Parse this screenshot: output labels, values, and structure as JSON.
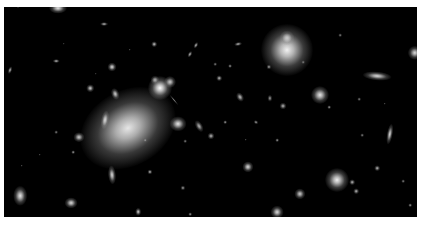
{
  "image": {
    "subject": "galaxy cluster deep field",
    "background": "#000000",
    "frame_color": "#ffffff"
  },
  "objects": [
    {
      "x": 128,
      "y": 128,
      "w": 46,
      "h": 34,
      "rot": -30,
      "b": 0.9,
      "halo": 2.2
    },
    {
      "x": 287,
      "y": 50,
      "w": 26,
      "h": 26,
      "rot": 0,
      "b": 0.95,
      "halo": 2.0
    },
    {
      "x": 287,
      "y": 38,
      "w": 10,
      "h": 10,
      "rot": 0,
      "b": 0.8,
      "halo": 1.5
    },
    {
      "x": 160,
      "y": 88,
      "w": 12,
      "h": 12,
      "rot": 0,
      "b": 1.0,
      "halo": 2.0
    },
    {
      "x": 170,
      "y": 82,
      "w": 8,
      "h": 8,
      "rot": 0,
      "b": 0.8,
      "halo": 1.5
    },
    {
      "x": 155,
      "y": 80,
      "w": 6,
      "h": 6,
      "rot": 0,
      "b": 0.7,
      "halo": 1.5
    },
    {
      "x": 174,
      "y": 100,
      "w": 14,
      "h": 2,
      "rot": 50,
      "b": 0.5,
      "halo": 1
    },
    {
      "x": 377,
      "y": 76,
      "w": 16,
      "h": 5,
      "rot": 5,
      "b": 0.85,
      "halo": 1.8
    },
    {
      "x": 320,
      "y": 95,
      "w": 10,
      "h": 10,
      "rot": 0,
      "b": 0.9,
      "halo": 1.8
    },
    {
      "x": 337,
      "y": 180,
      "w": 12,
      "h": 12,
      "rot": 0,
      "b": 0.95,
      "halo": 2.0
    },
    {
      "x": 105,
      "y": 120,
      "w": 5,
      "h": 12,
      "rot": 10,
      "b": 0.85,
      "halo": 1.6
    },
    {
      "x": 112,
      "y": 175,
      "w": 5,
      "h": 12,
      "rot": -5,
      "b": 0.85,
      "halo": 1.6
    },
    {
      "x": 20,
      "y": 196,
      "w": 8,
      "h": 12,
      "rot": 0,
      "b": 0.9,
      "halo": 1.7
    },
    {
      "x": 71,
      "y": 203,
      "w": 8,
      "h": 7,
      "rot": 0,
      "b": 0.85,
      "halo": 1.6
    },
    {
      "x": 79,
      "y": 137,
      "w": 7,
      "h": 6,
      "rot": 0,
      "b": 0.8,
      "halo": 1.6
    },
    {
      "x": 178,
      "y": 124,
      "w": 10,
      "h": 9,
      "rot": 0,
      "b": 0.9,
      "halo": 1.7
    },
    {
      "x": 199,
      "y": 126,
      "w": 5,
      "h": 9,
      "rot": -30,
      "b": 0.7,
      "halo": 1.4
    },
    {
      "x": 211,
      "y": 136,
      "w": 5,
      "h": 5,
      "rot": 0,
      "b": 0.7,
      "halo": 1.4
    },
    {
      "x": 248,
      "y": 167,
      "w": 7,
      "h": 7,
      "rot": 0,
      "b": 0.85,
      "halo": 1.6
    },
    {
      "x": 300,
      "y": 194,
      "w": 7,
      "h": 7,
      "rot": 0,
      "b": 0.8,
      "halo": 1.6
    },
    {
      "x": 277,
      "y": 212,
      "w": 8,
      "h": 8,
      "rot": 0,
      "b": 0.85,
      "halo": 1.6
    },
    {
      "x": 390,
      "y": 134,
      "w": 4,
      "h": 13,
      "rot": 10,
      "b": 0.85,
      "halo": 1.6
    },
    {
      "x": 415,
      "y": 53,
      "w": 9,
      "h": 9,
      "rot": 0,
      "b": 0.85,
      "halo": 1.6
    },
    {
      "x": 377,
      "y": 168,
      "w": 4,
      "h": 4,
      "rot": 0,
      "b": 0.7,
      "halo": 1.4
    },
    {
      "x": 352,
      "y": 182,
      "w": 4,
      "h": 4,
      "rot": 0,
      "b": 0.7,
      "halo": 1.4
    },
    {
      "x": 356,
      "y": 191,
      "w": 4,
      "h": 4,
      "rot": 0,
      "b": 0.7,
      "halo": 1.4
    },
    {
      "x": 283,
      "y": 106,
      "w": 5,
      "h": 5,
      "rot": 0,
      "b": 0.7,
      "halo": 1.4
    },
    {
      "x": 270,
      "y": 98,
      "w": 4,
      "h": 5,
      "rot": 0,
      "b": 0.6,
      "halo": 1.3
    },
    {
      "x": 240,
      "y": 97,
      "w": 5,
      "h": 7,
      "rot": -30,
      "b": 0.75,
      "halo": 1.4
    },
    {
      "x": 219,
      "y": 78,
      "w": 4,
      "h": 4,
      "rot": 0,
      "b": 0.7,
      "halo": 1.4
    },
    {
      "x": 230,
      "y": 66,
      "w": 3,
      "h": 3,
      "rot": 0,
      "b": 0.6,
      "halo": 1.3
    },
    {
      "x": 190,
      "y": 54,
      "w": 3,
      "h": 5,
      "rot": 30,
      "b": 0.7,
      "halo": 1.3
    },
    {
      "x": 196,
      "y": 45,
      "w": 3,
      "h": 5,
      "rot": 30,
      "b": 0.7,
      "halo": 1.3
    },
    {
      "x": 154,
      "y": 44,
      "w": 4,
      "h": 4,
      "rot": 0,
      "b": 0.75,
      "halo": 1.4
    },
    {
      "x": 104,
      "y": 24,
      "w": 6,
      "h": 3,
      "rot": 0,
      "b": 0.7,
      "halo": 1.3
    },
    {
      "x": 112,
      "y": 67,
      "w": 6,
      "h": 6,
      "rot": 0,
      "b": 0.85,
      "halo": 1.5
    },
    {
      "x": 115,
      "y": 94,
      "w": 5,
      "h": 8,
      "rot": -20,
      "b": 0.8,
      "halo": 1.5
    },
    {
      "x": 90,
      "y": 88,
      "w": 5,
      "h": 5,
      "rot": 0,
      "b": 0.8,
      "halo": 1.5
    },
    {
      "x": 56,
      "y": 61,
      "w": 5,
      "h": 3,
      "rot": 0,
      "b": 0.7,
      "halo": 1.3
    },
    {
      "x": 10,
      "y": 70,
      "w": 3,
      "h": 6,
      "rot": 20,
      "b": 0.7,
      "halo": 1.3
    },
    {
      "x": 58,
      "y": 8,
      "w": 10,
      "h": 6,
      "rot": 0,
      "b": 0.9,
      "halo": 1.8
    },
    {
      "x": 18,
      "y": 6,
      "w": 3,
      "h": 3,
      "rot": 0,
      "b": 0.7,
      "halo": 1.3
    },
    {
      "x": 238,
      "y": 44,
      "w": 6,
      "h": 3,
      "rot": -10,
      "b": 0.7,
      "halo": 1.3
    },
    {
      "x": 269,
      "y": 67,
      "w": 4,
      "h": 4,
      "rot": 0,
      "b": 0.6,
      "halo": 1.3
    },
    {
      "x": 303,
      "y": 62,
      "w": 3,
      "h": 3,
      "rot": 0,
      "b": 0.5,
      "halo": 1.2
    },
    {
      "x": 340,
      "y": 35,
      "w": 3,
      "h": 3,
      "rot": 0,
      "b": 0.5,
      "halo": 1.2
    },
    {
      "x": 329,
      "y": 107,
      "w": 3,
      "h": 3,
      "rot": 0,
      "b": 0.6,
      "halo": 1.2
    },
    {
      "x": 362,
      "y": 135,
      "w": 3,
      "h": 3,
      "rot": 0,
      "b": 0.5,
      "halo": 1.2
    },
    {
      "x": 215,
      "y": 64,
      "w": 3,
      "h": 3,
      "rot": 0,
      "b": 0.5,
      "halo": 1.2
    },
    {
      "x": 73,
      "y": 152,
      "w": 3,
      "h": 3,
      "rot": 0,
      "b": 0.6,
      "halo": 1.2
    },
    {
      "x": 56,
      "y": 132,
      "w": 3,
      "h": 3,
      "rot": 0,
      "b": 0.5,
      "halo": 1.2
    },
    {
      "x": 150,
      "y": 172,
      "w": 4,
      "h": 4,
      "rot": 0,
      "b": 0.7,
      "halo": 1.3
    },
    {
      "x": 183,
      "y": 188,
      "w": 4,
      "h": 4,
      "rot": 0,
      "b": 0.6,
      "halo": 1.3
    },
    {
      "x": 185,
      "y": 141,
      "w": 3,
      "h": 3,
      "rot": 0,
      "b": 0.5,
      "halo": 1.2
    },
    {
      "x": 138,
      "y": 212,
      "w": 4,
      "h": 6,
      "rot": 0,
      "b": 0.8,
      "halo": 1.4
    },
    {
      "x": 190,
      "y": 214,
      "w": 3,
      "h": 3,
      "rot": 0,
      "b": 0.6,
      "halo": 1.2
    },
    {
      "x": 22,
      "y": 166,
      "w": 2,
      "h": 2,
      "rot": 0,
      "b": 0.5,
      "halo": 1.2
    },
    {
      "x": 246,
      "y": 140,
      "w": 2,
      "h": 2,
      "rot": 0,
      "b": 0.5,
      "halo": 1.2
    },
    {
      "x": 277,
      "y": 140,
      "w": 3,
      "h": 3,
      "rot": 0,
      "b": 0.6,
      "halo": 1.2
    },
    {
      "x": 256,
      "y": 122,
      "w": 4,
      "h": 3,
      "rot": 30,
      "b": 0.6,
      "halo": 1.2
    },
    {
      "x": 225,
      "y": 122,
      "w": 3,
      "h": 3,
      "rot": 0,
      "b": 0.6,
      "halo": 1.2
    },
    {
      "x": 403,
      "y": 181,
      "w": 3,
      "h": 3,
      "rot": 0,
      "b": 0.5,
      "halo": 1.2
    },
    {
      "x": 385,
      "y": 104,
      "w": 2,
      "h": 2,
      "rot": 0,
      "b": 0.5,
      "halo": 1.2
    },
    {
      "x": 359,
      "y": 99,
      "w": 3,
      "h": 3,
      "rot": 0,
      "b": 0.5,
      "halo": 1.2
    },
    {
      "x": 410,
      "y": 205,
      "w": 3,
      "h": 3,
      "rot": 0,
      "b": 0.6,
      "halo": 1.2
    },
    {
      "x": 40,
      "y": 155,
      "w": 2,
      "h": 2,
      "rot": 0,
      "b": 0.5,
      "halo": 1.2
    },
    {
      "x": 130,
      "y": 50,
      "w": 2,
      "h": 2,
      "rot": 0,
      "b": 0.5,
      "halo": 1.2
    },
    {
      "x": 64,
      "y": 44,
      "w": 2,
      "h": 2,
      "rot": 0,
      "b": 0.4,
      "halo": 1.2
    },
    {
      "x": 96,
      "y": 74,
      "w": 2,
      "h": 2,
      "rot": 0,
      "b": 0.4,
      "halo": 1.2
    },
    {
      "x": 145,
      "y": 140,
      "w": 3,
      "h": 3,
      "rot": 0,
      "b": 0.6,
      "halo": 1.2
    }
  ]
}
